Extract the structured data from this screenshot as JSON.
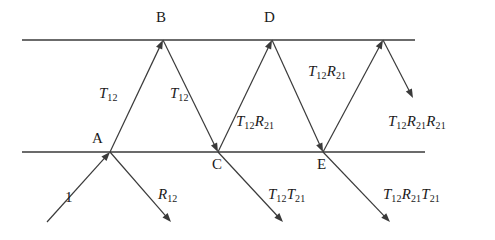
{
  "figure": {
    "type": "ray-diagram",
    "canvas": {
      "width": 495,
      "height": 240,
      "background": "#ffffff"
    },
    "stroke_color": "#3a3a3a",
    "text_color": "#1a1a1a",
    "interfaces": [
      {
        "name": "top-interface",
        "y": 40,
        "x1": 22,
        "x2": 415
      },
      {
        "name": "bottom-interface",
        "y": 152,
        "x1": 22,
        "x2": 425
      }
    ],
    "points": [
      {
        "id": "A",
        "label": "A",
        "x": 110,
        "y": 152,
        "label_x": 92,
        "label_y": 131
      },
      {
        "id": "B",
        "label": "B",
        "x": 163,
        "y": 40,
        "label_x": 156,
        "label_y": 10
      },
      {
        "id": "C",
        "label": "C",
        "x": 218,
        "y": 152,
        "label_x": 212,
        "label_y": 157
      },
      {
        "id": "D",
        "label": "D",
        "x": 272,
        "y": 40,
        "label_x": 264,
        "label_y": 10
      },
      {
        "id": "E",
        "label": "E",
        "x": 323,
        "y": 152,
        "label_x": 317,
        "label_y": 157
      },
      {
        "id": "F",
        "label": "",
        "x": 383,
        "y": 40,
        "label_x": 0,
        "label_y": 0
      }
    ],
    "rays": [
      {
        "name": "incident-ray",
        "x1": 47,
        "y1": 222,
        "x2": 110,
        "y2": 152,
        "arrow": "end"
      },
      {
        "name": "reflected-ray-R12",
        "x1": 110,
        "y1": 152,
        "x2": 171,
        "y2": 222,
        "arrow": "end"
      },
      {
        "name": "ray-A-to-B",
        "x1": 110,
        "y1": 152,
        "x2": 163,
        "y2": 40,
        "arrow": "end"
      },
      {
        "name": "ray-B-to-C",
        "x1": 163,
        "y1": 40,
        "x2": 218,
        "y2": 152,
        "arrow": "end"
      },
      {
        "name": "ray-C-transmitted",
        "x1": 218,
        "y1": 152,
        "x2": 283,
        "y2": 222,
        "arrow": "end"
      },
      {
        "name": "ray-C-to-D",
        "x1": 218,
        "y1": 152,
        "x2": 272,
        "y2": 40,
        "arrow": "end"
      },
      {
        "name": "ray-D-to-E",
        "x1": 272,
        "y1": 40,
        "x2": 323,
        "y2": 152,
        "arrow": "end"
      },
      {
        "name": "ray-E-transmitted",
        "x1": 323,
        "y1": 152,
        "x2": 390,
        "y2": 222,
        "arrow": "end"
      },
      {
        "name": "ray-E-to-F",
        "x1": 323,
        "y1": 152,
        "x2": 383,
        "y2": 40,
        "arrow": "end"
      },
      {
        "name": "ray-F-down",
        "x1": 383,
        "y1": 40,
        "x2": 413,
        "y2": 98,
        "arrow": "end"
      }
    ],
    "labels": [
      {
        "name": "label-incident-1",
        "style": "num",
        "x": 65,
        "y": 190,
        "text": "1",
        "sub": ""
      },
      {
        "name": "label-R12",
        "style": "ray",
        "x": 158,
        "y": 187,
        "base": "R",
        "sub": "12",
        "tail": ""
      },
      {
        "name": "label-T12-left",
        "style": "ray",
        "x": 99,
        "y": 86,
        "base": "T",
        "sub": "12",
        "tail": ""
      },
      {
        "name": "label-T12-right",
        "style": "ray",
        "x": 170,
        "y": 86,
        "base": "T",
        "sub": "12",
        "tail": ""
      },
      {
        "name": "label-T12T21",
        "style": "ray-multi",
        "x": 268,
        "y": 187,
        "parts": [
          [
            "T",
            "12"
          ],
          [
            "T",
            "21"
          ]
        ]
      },
      {
        "name": "label-T12R21-left",
        "style": "ray-multi",
        "x": 236,
        "y": 114,
        "parts": [
          [
            "T",
            "12"
          ],
          [
            "R",
            "21"
          ]
        ]
      },
      {
        "name": "label-T12R21-upper",
        "style": "ray-multi",
        "x": 308,
        "y": 64,
        "parts": [
          [
            "T",
            "12"
          ],
          [
            "R",
            "21"
          ]
        ]
      },
      {
        "name": "label-T12R21R21",
        "style": "ray-multi",
        "x": 388,
        "y": 114,
        "parts": [
          [
            "T",
            "12"
          ],
          [
            "R",
            "21"
          ],
          [
            "R",
            "21"
          ]
        ]
      },
      {
        "name": "label-T12R21T21",
        "style": "ray-multi",
        "x": 383,
        "y": 187,
        "parts": [
          [
            "T",
            "12"
          ],
          [
            "R",
            "21"
          ],
          [
            "T",
            "21"
          ]
        ]
      }
    ]
  }
}
